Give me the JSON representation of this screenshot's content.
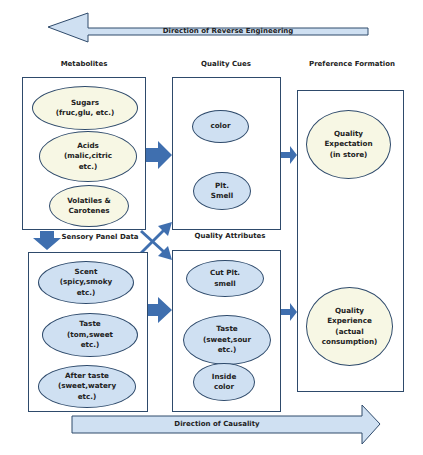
{
  "banners": {
    "top": "Direction of Reverse Engineering",
    "bottom": "Direction of Causality"
  },
  "headers": {
    "metabolites": "Metabolites",
    "quality_cues": "Quality Cues",
    "preference_formation": "Preference Formation",
    "sensory_panel": "Sensory Panel Data",
    "quality_attributes": "Quality Attributes"
  },
  "metabolites": [
    "Sugars\n(fruc,glu, etc.)",
    "Acids\n(malic,citric\netc.)",
    "Volatiles &\nCarotenes"
  ],
  "quality_cues": [
    "color",
    "Plt.\nSmell"
  ],
  "sensory_panel": [
    "Scent\n(spicy,smoky\netc.)",
    "Taste\n(tom,sweet\netc.)",
    "After taste\n(sweet,watery\netc.)"
  ],
  "quality_attributes": [
    "Cut Plt.\nsmell",
    "Taste\n(sweet,sour\netc.)",
    "Inside\ncolor"
  ],
  "preference": {
    "expectation": "Quality\nExpectation\n(in store)",
    "experience": "Quality\nExperience\n(actual\nconsumption)"
  },
  "colors": {
    "arrow_fill": "#3f6faf",
    "banner_fill": "#cfe0f2",
    "border": "#2e4a6b",
    "cream": "#f7f7e4",
    "blue_ellipse": "#cfe0f2"
  }
}
